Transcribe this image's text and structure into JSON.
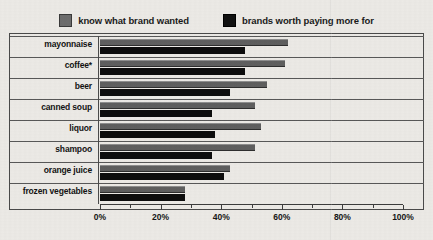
{
  "legend": {
    "entries": [
      {
        "label": "know what brand wanted",
        "swatch": "gray",
        "color": "#5f5f5f"
      },
      {
        "label": "brands worth paying more for",
        "swatch": "black",
        "color": "#0d0d0d"
      }
    ]
  },
  "axis": {
    "tick_labels": [
      "0%",
      "20%",
      "40%",
      "60%",
      "80%",
      "100%"
    ],
    "tick_values": [
      0,
      20,
      40,
      60,
      80,
      100
    ],
    "minor_values": [
      10,
      30,
      50,
      70,
      90
    ]
  },
  "categories": [
    "mayonnaise",
    "coffee*",
    "beer",
    "canned soup",
    "liquor",
    "shampoo",
    "orange juice",
    "frozen vegetables"
  ],
  "chart_data": {
    "type": "bar",
    "orientation": "horizontal",
    "title": "",
    "subtitle": "",
    "xlabel": "",
    "ylabel": "",
    "xlim": [
      0,
      100
    ],
    "xtick_labels": [
      "0%",
      "20%",
      "40%",
      "60%",
      "80%",
      "100%"
    ],
    "xticks": [
      0,
      20,
      40,
      60,
      80,
      100
    ],
    "grid": false,
    "legend_position": "top",
    "categories": [
      "mayonnaise",
      "coffee*",
      "beer",
      "canned soup",
      "liquor",
      "shampoo",
      "orange juice",
      "frozen vegetables"
    ],
    "series": [
      {
        "name": "know what brand wanted",
        "color": "#5f5f5f",
        "values": [
          62,
          61,
          55,
          51,
          53,
          51,
          43,
          28
        ]
      },
      {
        "name": "brands worth paying more for",
        "color": "#0d0d0d",
        "values": [
          48,
          48,
          43,
          37,
          38,
          37,
          41,
          28
        ]
      }
    ],
    "annotations": [
      "coffee*"
    ]
  }
}
